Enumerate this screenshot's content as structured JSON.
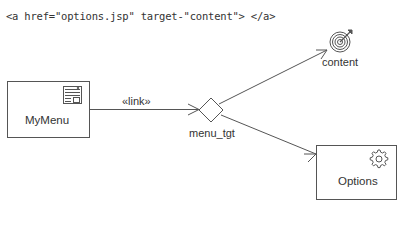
{
  "code_snippet": "<a href=\"options.jsp\" target-\"content\"> </a>",
  "nodes": {
    "mymenu": {
      "label": "MyMenu",
      "icon": "web-page-icon"
    },
    "menu_tgt": {
      "label": "menu_tgt",
      "shape": "diamond"
    },
    "content": {
      "label": "content",
      "icon": "target-icon"
    },
    "options": {
      "label": "Options",
      "icon": "gear-icon"
    }
  },
  "edges": [
    {
      "from": "MyMenu",
      "to": "menu_tgt",
      "stereotype": "«link»"
    },
    {
      "from": "menu_tgt",
      "to": "content",
      "stereotype": ""
    },
    {
      "from": "menu_tgt",
      "to": "Options",
      "stereotype": ""
    }
  ],
  "colors": {
    "line": "#555555",
    "text": "#333333"
  }
}
